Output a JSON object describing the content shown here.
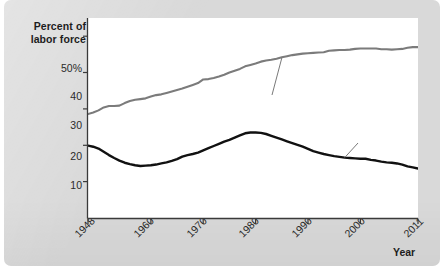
{
  "chart_data": {
    "type": "line",
    "title": "",
    "xlabel": "Year",
    "ylabel": "Percent of labor force",
    "xlim": [
      1948,
      2011
    ],
    "ylim": [
      0,
      55
    ],
    "grid": false,
    "legend_position": "inline-annotations",
    "x_tick_labels": [
      "1948",
      "1960",
      "1970",
      "1980",
      "1990",
      "2000",
      "2011"
    ],
    "x_tick_values": [
      1948,
      1960,
      1970,
      1980,
      1990,
      2000,
      2011
    ],
    "y_tick_labels": [
      "50%",
      "40",
      "30",
      "20",
      "10"
    ],
    "y_tick_values": [
      50,
      40,
      30,
      20,
      10
    ],
    "series": [
      {
        "name": "Women",
        "color": "#7b7b7b",
        "label_text": "Women",
        "x": [
          1948,
          1949,
          1950,
          1951,
          1952,
          1953,
          1954,
          1955,
          1956,
          1957,
          1958,
          1959,
          1960,
          1961,
          1962,
          1963,
          1964,
          1965,
          1966,
          1967,
          1968,
          1969,
          1970,
          1971,
          1972,
          1973,
          1974,
          1975,
          1976,
          1977,
          1978,
          1979,
          1980,
          1981,
          1982,
          1983,
          1984,
          1985,
          1986,
          1987,
          1988,
          1989,
          1990,
          1991,
          1992,
          1993,
          1994,
          1995,
          1996,
          1997,
          1998,
          1999,
          2000,
          2001,
          2002,
          2003,
          2004,
          2005,
          2006,
          2007,
          2008,
          2009,
          2010,
          2011
        ],
        "values": [
          28.6,
          29.0,
          29.6,
          30.4,
          30.8,
          30.8,
          30.9,
          31.6,
          32.2,
          32.5,
          32.7,
          32.9,
          33.4,
          33.8,
          34.0,
          34.4,
          34.8,
          35.2,
          35.6,
          36.1,
          36.6,
          37.1,
          38.1,
          38.2,
          38.5,
          38.9,
          39.4,
          40.0,
          40.5,
          41.0,
          41.7,
          42.1,
          42.5,
          43.0,
          43.3,
          43.5,
          43.8,
          44.2,
          44.5,
          44.8,
          45.0,
          45.2,
          45.3,
          45.4,
          45.5,
          45.6,
          46.0,
          46.1,
          46.2,
          46.2,
          46.3,
          46.5,
          46.6,
          46.6,
          46.6,
          46.6,
          46.4,
          46.4,
          46.3,
          46.4,
          46.5,
          46.8,
          47.0,
          47.0
        ]
      },
      {
        "name": "Under 25",
        "color": "#111111",
        "label_text": "Under 25",
        "x": [
          1948,
          1949,
          1950,
          1951,
          1952,
          1953,
          1954,
          1955,
          1956,
          1957,
          1958,
          1959,
          1960,
          1961,
          1962,
          1963,
          1964,
          1965,
          1966,
          1967,
          1968,
          1969,
          1970,
          1971,
          1972,
          1973,
          1974,
          1975,
          1976,
          1977,
          1978,
          1979,
          1980,
          1981,
          1982,
          1983,
          1984,
          1985,
          1986,
          1987,
          1988,
          1989,
          1990,
          1991,
          1992,
          1993,
          1994,
          1995,
          1996,
          1997,
          1998,
          1999,
          2000,
          2001,
          2002,
          2003,
          2004,
          2005,
          2006,
          2007,
          2008,
          2009,
          2010,
          2011
        ],
        "values": [
          19.9,
          19.6,
          19.1,
          18.2,
          17.3,
          16.5,
          15.8,
          15.2,
          14.8,
          14.5,
          14.3,
          14.4,
          14.5,
          14.7,
          15.0,
          15.3,
          15.7,
          16.2,
          16.9,
          17.3,
          17.6,
          18.0,
          18.6,
          19.2,
          19.8,
          20.4,
          21.0,
          21.5,
          22.1,
          22.7,
          23.3,
          23.5,
          23.5,
          23.4,
          23.1,
          22.6,
          22.1,
          21.6,
          21.1,
          20.6,
          20.1,
          19.6,
          19.0,
          18.4,
          18.0,
          17.6,
          17.3,
          17.0,
          16.8,
          16.6,
          16.5,
          16.4,
          16.3,
          16.3,
          16.0,
          15.8,
          15.5,
          15.3,
          15.2,
          15.0,
          14.7,
          14.2,
          13.9,
          13.6
        ]
      }
    ]
  },
  "axes": {
    "y_title_line1": "Percent of",
    "y_title_line2": "labor force",
    "x_title": "Year"
  },
  "colors": {
    "panel_background": "#d9d9d9",
    "plot_background": "#ffffff",
    "axis": "#3a3a3a",
    "women_line": "#7b7b7b",
    "under25_line": "#111111",
    "label_badge": "#dcdcdc"
  }
}
